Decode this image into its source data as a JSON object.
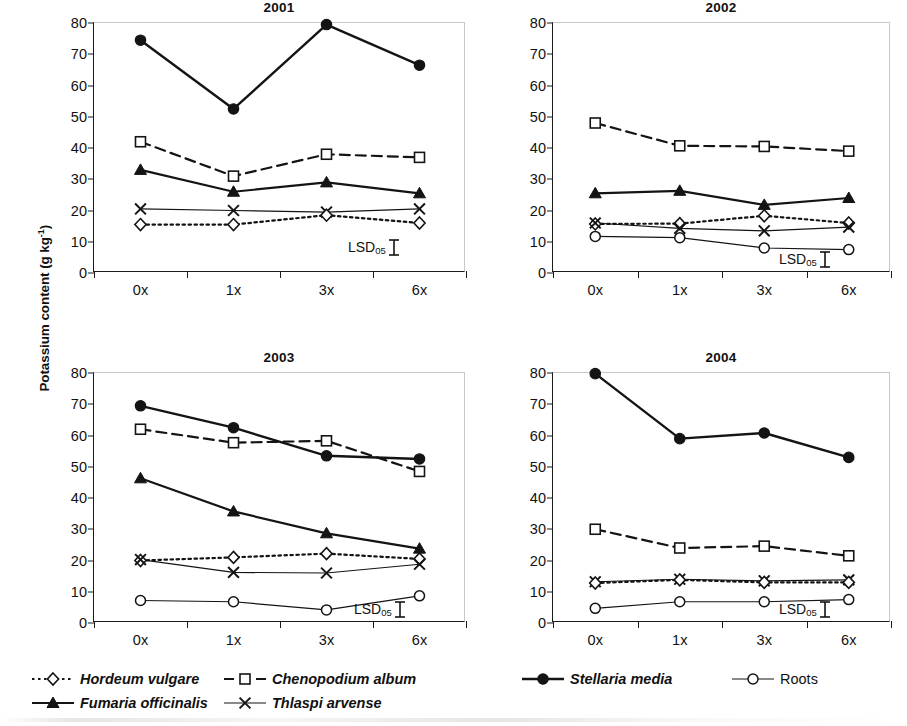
{
  "figure": {
    "ylabel": "Potassium content (g kg",
    "ylabel_sup": "-1",
    "ylabel_close": ")"
  },
  "axis": {
    "yticks": [
      "80",
      "70",
      "60",
      "50",
      "40",
      "30",
      "20",
      "10",
      "0"
    ],
    "ytick_values": [
      80,
      70,
      60,
      50,
      40,
      30,
      20,
      10,
      0
    ],
    "ymin": 0,
    "ymax": 80,
    "xcategories": [
      "0x",
      "1x",
      "3x",
      "6x"
    ],
    "lsd_label": "LSD",
    "lsd_sub": "05"
  },
  "legend": {
    "items": [
      {
        "name": "Hordeum vulgare",
        "marker": "diamond-open",
        "line": "dotted",
        "italic": true
      },
      {
        "name": "Chenopodium album",
        "marker": "square-open",
        "line": "dashdot",
        "italic": true
      },
      {
        "name": "Stellaria media",
        "marker": "circle-filled",
        "line": "solid",
        "italic": true
      },
      {
        "name": "Fumaria officinalis",
        "marker": "triangle-filled",
        "line": "solid-thick",
        "italic": true
      },
      {
        "name": "Thlaspi arvense",
        "marker": "cross",
        "line": "solid-thin",
        "italic": true
      },
      {
        "name": "Roots",
        "marker": "circle-open",
        "line": "solid-thin",
        "italic": false
      }
    ]
  },
  "chart_data": [
    {
      "type": "line",
      "title": "2001",
      "xlabel": "",
      "ylabel": "Potassium content (g kg-1)",
      "categories": [
        "0x",
        "1x",
        "3x",
        "6x"
      ],
      "ylim": [
        0,
        80
      ],
      "grid": false,
      "legend_position": "bottom",
      "lsd": 2.5,
      "series": [
        {
          "name": "Stellaria media",
          "marker": "circle-filled",
          "line": "solid",
          "values": [
            74.5,
            52.5,
            79.5,
            66.5
          ]
        },
        {
          "name": "Chenopodium album",
          "marker": "square-open",
          "line": "dashed",
          "values": [
            42.0,
            31.0,
            38.0,
            37.0
          ]
        },
        {
          "name": "Fumaria officinalis",
          "marker": "triangle-filled",
          "line": "solid",
          "values": [
            33.0,
            26.0,
            29.0,
            25.5
          ]
        },
        {
          "name": "Thlaspi arvense",
          "marker": "cross",
          "line": "solid-thin",
          "values": [
            20.5,
            20.0,
            19.5,
            20.5
          ]
        },
        {
          "name": "Hordeum vulgare",
          "marker": "diamond-open",
          "line": "dotted",
          "values": [
            15.5,
            15.5,
            18.5,
            16.0
          ]
        }
      ]
    },
    {
      "type": "line",
      "title": "2002",
      "xlabel": "",
      "ylabel": "Potassium content (g kg-1)",
      "categories": [
        "0x",
        "1x",
        "3x",
        "6x"
      ],
      "ylim": [
        0,
        80
      ],
      "grid": false,
      "legend_position": "bottom",
      "lsd": 2.0,
      "series": [
        {
          "name": "Chenopodium album",
          "marker": "square-open",
          "line": "dashed",
          "values": [
            48.0,
            40.7,
            40.5,
            39.0
          ]
        },
        {
          "name": "Fumaria officinalis",
          "marker": "triangle-filled",
          "line": "solid",
          "values": [
            25.5,
            26.3,
            21.8,
            24.0
          ]
        },
        {
          "name": "Hordeum vulgare",
          "marker": "diamond-open",
          "line": "dotted",
          "values": [
            15.7,
            15.8,
            18.3,
            16.0
          ]
        },
        {
          "name": "Thlaspi arvense",
          "marker": "cross",
          "line": "solid-thin",
          "values": [
            16.0,
            14.3,
            13.5,
            14.7
          ]
        },
        {
          "name": "Roots",
          "marker": "circle-open",
          "line": "solid-thin",
          "values": [
            11.7,
            11.3,
            8.0,
            7.5
          ]
        }
      ]
    },
    {
      "type": "line",
      "title": "2003",
      "xlabel": "",
      "ylabel": "Potassium content (g kg-1)",
      "categories": [
        "0x",
        "1x",
        "3x",
        "6x"
      ],
      "ylim": [
        0,
        80
      ],
      "grid": false,
      "legend_position": "bottom",
      "lsd": 2.0,
      "series": [
        {
          "name": "Stellaria media",
          "marker": "circle-filled",
          "line": "solid",
          "values": [
            69.5,
            62.5,
            53.5,
            52.5
          ]
        },
        {
          "name": "Chenopodium album",
          "marker": "square-open",
          "line": "dashed",
          "values": [
            62.0,
            57.7,
            58.3,
            48.5
          ]
        },
        {
          "name": "Fumaria officinalis",
          "marker": "triangle-filled",
          "line": "solid",
          "values": [
            46.3,
            35.7,
            28.7,
            23.8
          ]
        },
        {
          "name": "Hordeum vulgare",
          "marker": "diamond-open",
          "line": "dotted",
          "values": [
            20.0,
            21.0,
            22.2,
            20.5
          ]
        },
        {
          "name": "Thlaspi arvense",
          "marker": "cross",
          "line": "solid-thin",
          "values": [
            20.3,
            16.2,
            16.0,
            18.8
          ]
        },
        {
          "name": "Roots",
          "marker": "circle-open",
          "line": "solid-thin",
          "values": [
            7.2,
            6.8,
            4.2,
            8.7
          ]
        }
      ]
    },
    {
      "type": "line",
      "title": "2004",
      "xlabel": "",
      "ylabel": "Potassium content (g kg-1)",
      "categories": [
        "0x",
        "1x",
        "3x",
        "6x"
      ],
      "ylim": [
        0,
        80
      ],
      "grid": false,
      "legend_position": "bottom",
      "lsd": 2.0,
      "series": [
        {
          "name": "Stellaria media",
          "marker": "circle-filled",
          "line": "solid",
          "values": [
            79.8,
            59.0,
            60.8,
            53.0
          ]
        },
        {
          "name": "Chenopodium album",
          "marker": "square-open",
          "line": "dashed",
          "values": [
            30.0,
            24.0,
            24.6,
            21.5
          ]
        },
        {
          "name": "Thlaspi arvense",
          "marker": "cross",
          "line": "solid-thin",
          "values": [
            13.2,
            14.0,
            13.5,
            13.8
          ]
        },
        {
          "name": "Hordeum vulgare",
          "marker": "diamond-open",
          "line": "dotted",
          "values": [
            12.8,
            13.8,
            13.0,
            13.0
          ]
        },
        {
          "name": "Roots",
          "marker": "circle-open",
          "line": "solid-thin",
          "values": [
            4.7,
            6.8,
            6.8,
            7.5
          ]
        }
      ]
    }
  ]
}
